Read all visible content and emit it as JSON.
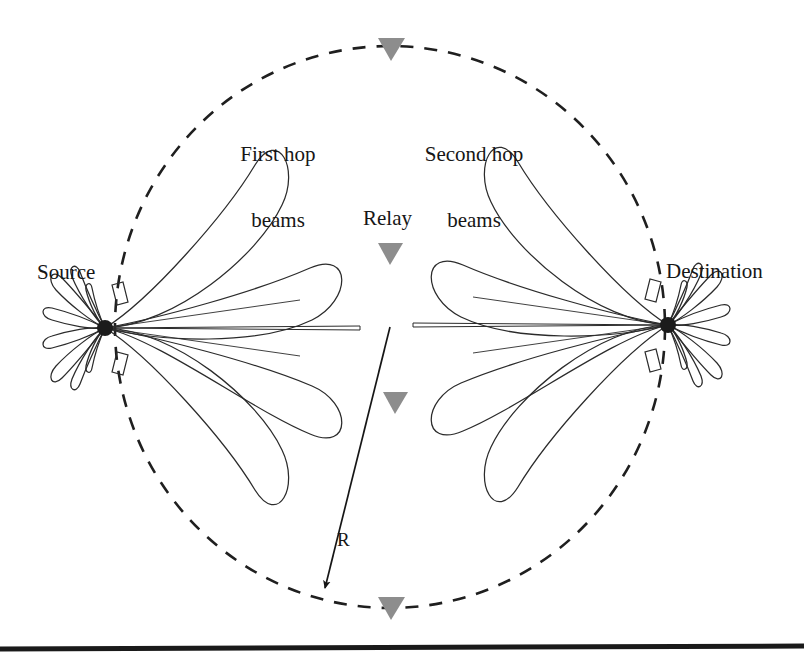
{
  "figure": {
    "background_color": "#ffffff",
    "line_color": "#262626",
    "marker_color": "#8a8a8a",
    "labels": {
      "source": "Source",
      "destination": "Destination",
      "relay": "Relay",
      "first_hop_line1": "First hop",
      "first_hop_line2": "beams",
      "second_hop_line1": "Second hop",
      "second_hop_line2": "beams",
      "radius": "R"
    },
    "geometry": {
      "coverage_circle": {
        "center_x": 390,
        "center_y": 327,
        "radius_x": 275,
        "radius_y": 281,
        "stroke": "dashed"
      },
      "source_node": {
        "x": 105,
        "y": 328
      },
      "destination_node": {
        "x": 668,
        "y": 325
      },
      "radius_arrow": {
        "from_x": 390,
        "from_y": 327,
        "to_x": 323,
        "to_y": 592
      },
      "relay_markers": [
        {
          "name": "relay-top",
          "x": 391,
          "y": 48
        },
        {
          "name": "relay-upper-middle",
          "x": 390,
          "y": 253
        },
        {
          "name": "relay-lower-middle",
          "x": 395,
          "y": 402
        },
        {
          "name": "relay-bottom",
          "x": 391,
          "y": 607
        }
      ],
      "source_beam_count": 4,
      "destination_beam_count": 4,
      "source_beam_angles_deg": [
        -55,
        -18,
        18,
        55
      ],
      "destination_beam_angles_deg": [
        125,
        162,
        198,
        235
      ]
    },
    "footer_rule": {
      "y": 647,
      "thickness": 5
    }
  }
}
